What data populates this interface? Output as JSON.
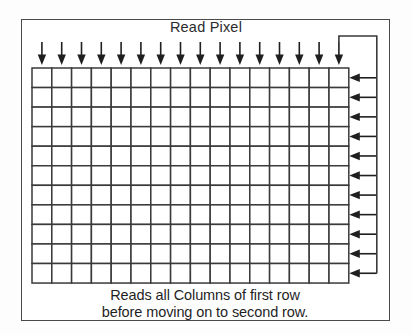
{
  "figure": {
    "title": "Read Pixel",
    "caption_lines": [
      "Reads all Columns of first row",
      "before moving on to second row."
    ],
    "colors": {
      "background": "#ffffff",
      "frame_stroke": "#4a4a4a",
      "grid_stroke": "#3a3a3a",
      "arrow_fill": "#1f1f1f",
      "text": "#1f1f1f"
    },
    "grid": {
      "columns": 16,
      "rows": 11,
      "left": 32,
      "top": 68,
      "cell_width": 19.8,
      "cell_height": 19.55
    },
    "arrows": {
      "top_down_count": 16,
      "right_left_count": 11,
      "top_down_label": "column-scan-arrow",
      "right_left_label": "row-return-arrow",
      "return_path_label": "scan-return-path"
    },
    "frame": {
      "left": 21,
      "top": 19,
      "width": 369,
      "height": 302
    }
  }
}
